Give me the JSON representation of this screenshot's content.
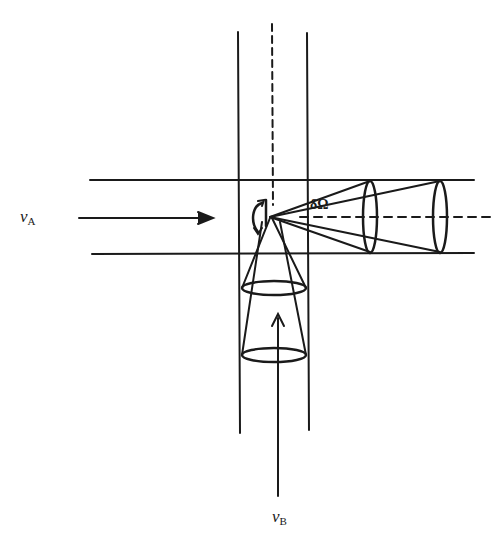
{
  "diagram": {
    "type": "crossed-beam scattering geometry",
    "labels": {
      "beam_a": {
        "symbol": "v",
        "subscript": "A"
      },
      "beam_b": {
        "symbol": "v",
        "subscript": "B"
      },
      "solid_angle": "δΩ"
    },
    "colors": {
      "ink": "#1a1a1a",
      "background": "#ffffff"
    }
  }
}
